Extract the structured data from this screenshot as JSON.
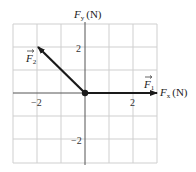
{
  "diagram": {
    "type": "force-vector-diagram",
    "axes": {
      "x_label": "F",
      "x_sub": "x",
      "x_unit": "(N)",
      "y_label": "F",
      "y_sub": "y",
      "y_unit": "(N)",
      "x_range": [
        -3,
        3
      ],
      "y_range": [
        -3,
        3
      ],
      "x_ticks": [
        {
          "value": -2,
          "label": "−2"
        },
        {
          "value": 2,
          "label": "2"
        }
      ],
      "y_ticks": [
        {
          "value": 2,
          "label": "2"
        },
        {
          "value": -2,
          "label": "−2"
        }
      ],
      "grid": true
    },
    "vectors": [
      {
        "name": "F",
        "sub": "1",
        "from": [
          0,
          0
        ],
        "to": [
          3,
          0
        ]
      },
      {
        "name": "F",
        "sub": "2",
        "from": [
          0,
          0
        ],
        "to": [
          -2,
          2
        ]
      }
    ],
    "colors": {
      "grid": "#cfcfcf",
      "axis": "#555555",
      "vector": "#1a1a1a"
    }
  }
}
